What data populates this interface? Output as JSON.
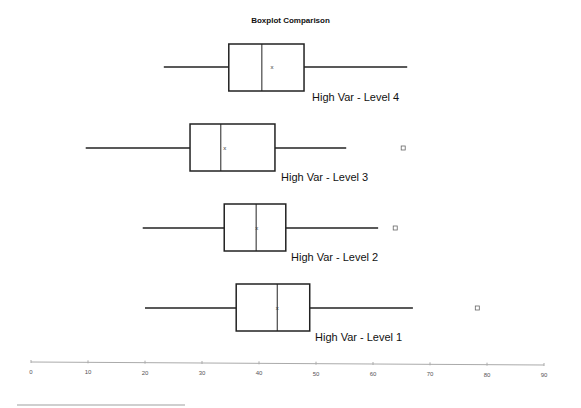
{
  "chart_data": {
    "type": "boxplot",
    "orientation": "horizontal",
    "title": "Boxplot Comparison",
    "xlabel": "",
    "ylabel": "",
    "xlim": [
      0,
      90
    ],
    "x_ticks": [
      0,
      10,
      20,
      30,
      40,
      50,
      60,
      70,
      80,
      90
    ],
    "grid": false,
    "legend": null,
    "series": [
      {
        "name": "High Var - Level 4",
        "min": 23.3,
        "q1": 34.7,
        "median": 40.5,
        "mean": 42.3,
        "q3": 47.9,
        "max": 66.0,
        "outliers": []
      },
      {
        "name": "High Var - Level 3",
        "min": 9.6,
        "q1": 27.9,
        "median": 33.3,
        "mean": 34.0,
        "q3": 42.8,
        "max": 55.3,
        "outliers": [
          65.3
        ]
      },
      {
        "name": "High Var - Level 2",
        "min": 19.6,
        "q1": 33.9,
        "median": 39.5,
        "mean": 39.6,
        "q3": 44.7,
        "max": 60.9,
        "outliers": [
          63.9
        ]
      },
      {
        "name": "High Var - Level 1",
        "min": 20.0,
        "q1": 36.0,
        "median": 43.2,
        "mean": 43.2,
        "q3": 48.9,
        "max": 67.0,
        "outliers": [
          78.3
        ]
      }
    ],
    "mean_marker": "x",
    "outlier_marker": "square"
  },
  "layout": {
    "axis": {
      "x0": 31,
      "x1": 544,
      "y0": 362,
      "y1": 365
    },
    "rows": [
      {
        "cy": 67,
        "top": 44,
        "bottom": 91,
        "label_x": 312,
        "label_y": 101
      },
      {
        "cy": 148,
        "top": 124,
        "bottom": 171,
        "label_x": 281,
        "label_y": 181
      },
      {
        "cy": 228,
        "top": 204,
        "bottom": 251,
        "label_x": 291,
        "label_y": 261
      },
      {
        "cy": 308,
        "top": 284,
        "bottom": 331,
        "label_x": 315,
        "label_y": 341
      }
    ]
  }
}
